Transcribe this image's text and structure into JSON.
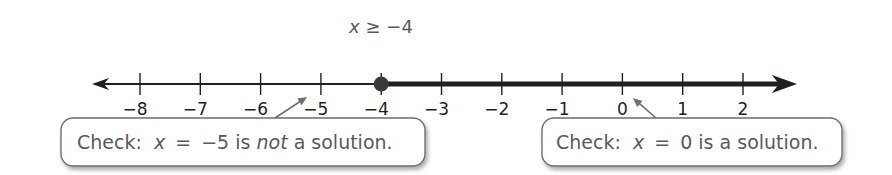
{
  "number_line": {
    "min": -8,
    "max": 2,
    "tick_values": [
      -8,
      -7,
      -6,
      -5,
      -4,
      -3,
      -2,
      -1,
      0,
      1,
      2
    ],
    "tick_labels": [
      "−8",
      "−7",
      "−6",
      "−5",
      "−4",
      "−3",
      "−2",
      "−1",
      "0",
      "1",
      "2"
    ],
    "graph": {
      "inequality_label": {
        "variable": "x",
        "relation": "≥",
        "value": "−4"
      },
      "endpoint_value": -4,
      "endpoint_type": "closed",
      "direction": "right"
    },
    "colors": {
      "line": "#231f20",
      "dot": "#3a3a3c",
      "label_text": "#58595b",
      "callout_border": "#6d6e71",
      "callout_arrow": "#6d6e71"
    }
  },
  "callouts": [
    {
      "prefix": "Check:",
      "variable": "x",
      "equals": "=",
      "value": "−5",
      "middle": "is",
      "emphasis": "not",
      "suffix": "a solution.",
      "points_to_value": -5
    },
    {
      "prefix": "Check:",
      "variable": "x",
      "equals": "=",
      "value": "0",
      "middle": "is",
      "emphasis": "",
      "suffix": "a solution.",
      "points_to_value": 0
    }
  ]
}
